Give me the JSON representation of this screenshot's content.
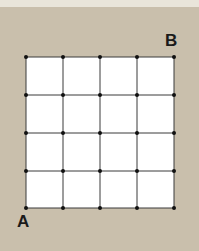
{
  "diagram": {
    "type": "grid",
    "rows": 4,
    "cols": 4,
    "labels": {
      "start": "A",
      "end": "B"
    },
    "colors": {
      "background": "#c9bfac",
      "grid_fill": "#ffffff",
      "line": "#333333",
      "dot": "#111111"
    }
  }
}
